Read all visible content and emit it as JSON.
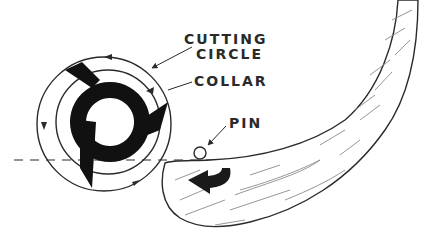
{
  "diagram": {
    "labels": {
      "cutting_circle_line1": "CUTTING",
      "cutting_circle_line2": "CIRCLE",
      "collar": "COLLAR",
      "pin": "PIN"
    },
    "colors": {
      "ink": "#2a2a2a",
      "grain": "#8a8a8a",
      "background": "#ffffff"
    },
    "elements": [
      "cutting-circle",
      "collar-circle",
      "cutter-blade",
      "pin",
      "workpiece",
      "feed-direction-arrow",
      "centerline"
    ]
  }
}
